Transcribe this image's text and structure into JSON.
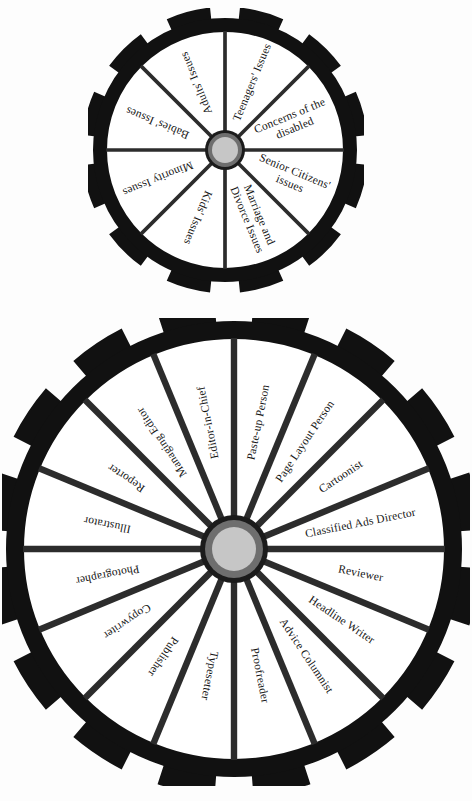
{
  "page": {
    "background_color": "#fdfdfd",
    "ink_color": "#111111"
  },
  "wheels": [
    {
      "id": "issues-wheel",
      "name": "issues-wheel",
      "sector_count": 8,
      "tooth_count": 12,
      "center": {
        "x": 137,
        "y": 142
      },
      "outer_radius": 132,
      "rim_inner_radius": 118,
      "hub_outer_radius": 20,
      "hub_mid_radius": 17,
      "hub_inner_radius": 13,
      "start_angle_deg": -90,
      "rim_color": "#111111",
      "hub_colors": {
        "outer": "#1b1b1b",
        "mid": "#6e6e6e",
        "inner": "#c6c6c6"
      },
      "labels": [
        "Teenagers' Issues",
        "Concerns of the disabled",
        "Senior Citizens' issues",
        "Marriage and Divorce Issues",
        "Kids' Issues",
        "Minority Issues",
        "Babies' Issues",
        "Adults' Issues"
      ]
    },
    {
      "id": "newspaper-roles-wheel",
      "name": "newspaper-roles-wheel",
      "sector_count": 16,
      "tooth_count": 16,
      "center": {
        "x": 232,
        "y": 231
      },
      "outer_radius": 228,
      "rim_inner_radius": 210,
      "hub_outer_radius": 34,
      "hub_mid_radius": 29,
      "hub_inner_radius": 22,
      "start_angle_deg": -90,
      "rim_color": "#111111",
      "hub_colors": {
        "outer": "#1b1b1b",
        "mid": "#6e6e6e",
        "inner": "#c6c6c6"
      },
      "labels": [
        "Paste-up Person",
        "Page Layout Person",
        "Cartoonist",
        "Classified Ads Director",
        "Reviewer",
        "Headline Writer",
        "Advice Columnist",
        "Proofreader",
        "Typesetter",
        "Publisher",
        "Copywriter",
        "Photographer",
        "Illustrator",
        "Reporter",
        "Managing Editor",
        "Editor-in-Chief"
      ]
    }
  ]
}
